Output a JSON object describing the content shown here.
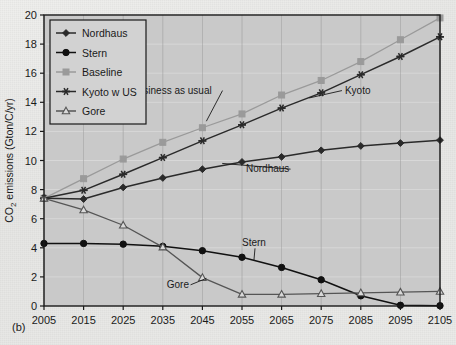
{
  "figure": {
    "panel_label": "(b)",
    "background_color": "#c9c9c9",
    "frame_color": "#1a1a1a"
  },
  "chart_data": {
    "type": "line",
    "title": "",
    "xlabel": "",
    "ylabel": "CO2 emissions (Gton/C/yr)",
    "ylabel_parts": {
      "pre": "CO",
      "sub": "2",
      "post": " emissions (Gton/C/yr)"
    },
    "xlim": [
      2005,
      2105
    ],
    "ylim": [
      0,
      20
    ],
    "ytick_step": 2,
    "grid": true,
    "legend_position": "upper-left",
    "x": [
      2005,
      2015,
      2025,
      2035,
      2045,
      2055,
      2065,
      2075,
      2085,
      2095,
      2105
    ],
    "categories": [
      "2005",
      "2015",
      "2025",
      "2035",
      "2045",
      "2055",
      "2065",
      "2075",
      "2085",
      "2095",
      "2105"
    ],
    "yticks": [
      "0",
      "2",
      "4",
      "6",
      "8",
      "10",
      "12",
      "14",
      "16",
      "18",
      "20"
    ],
    "series": [
      {
        "name": "Nordhaus",
        "marker": "diamond",
        "color": "#2a2a2a",
        "values": [
          7.4,
          7.35,
          8.15,
          8.8,
          9.4,
          9.9,
          10.25,
          10.7,
          11.0,
          11.2,
          11.4
        ]
      },
      {
        "name": "Stern",
        "marker": "circle",
        "color": "#111111",
        "values": [
          4.3,
          4.3,
          4.25,
          4.1,
          3.8,
          3.35,
          2.65,
          1.8,
          0.7,
          0.05,
          0.02
        ]
      },
      {
        "name": "Baseline",
        "marker": "square",
        "color": "#9a9a9a",
        "values": [
          7.4,
          8.75,
          10.1,
          11.25,
          12.25,
          13.2,
          14.5,
          15.5,
          16.8,
          18.3,
          19.8
        ]
      },
      {
        "name": "Kyoto w US",
        "marker": "asterisk",
        "color": "#2a2a2a",
        "values": [
          7.4,
          7.95,
          9.05,
          10.2,
          11.35,
          12.45,
          13.6,
          14.65,
          15.9,
          17.15,
          18.5
        ]
      },
      {
        "name": "Gore",
        "marker": "triangle",
        "color": "#555555",
        "values": [
          7.4,
          6.6,
          5.55,
          4.05,
          1.95,
          0.8,
          0.8,
          0.85,
          0.9,
          0.95,
          1.0
        ]
      }
    ],
    "annotations": [
      {
        "text": "Business as usual",
        "x": 2027,
        "y": 14.6,
        "leader_to_x": 2046,
        "leader_to_y": 12.7
      },
      {
        "text": "Kyoto",
        "x": 2081,
        "y": 14.6,
        "leader_to_x": 2072,
        "leader_to_y": 14.3
      },
      {
        "text": "Nordhaus",
        "x": 2056,
        "y": 9.2,
        "leader_to_x": 2050,
        "leader_to_y": 9.8
      },
      {
        "text": "Stern",
        "x": 2055,
        "y": 4.1,
        "leader_to_x": 2058,
        "leader_to_y": 3.1
      },
      {
        "text": "Gore",
        "x": 2036,
        "y": 1.25,
        "leader_to_x": 2046,
        "leader_to_y": 1.9
      }
    ]
  },
  "legend": {
    "items": [
      {
        "label": "Nordhaus",
        "marker": "diamond",
        "color": "#2a2a2a"
      },
      {
        "label": "Stern",
        "marker": "circle",
        "color": "#111111"
      },
      {
        "label": "Baseline",
        "marker": "square",
        "color": "#9a9a9a"
      },
      {
        "label": "Kyoto w US",
        "marker": "asterisk",
        "color": "#2a2a2a"
      },
      {
        "label": "Gore",
        "marker": "triangle",
        "color": "#555555"
      }
    ]
  }
}
